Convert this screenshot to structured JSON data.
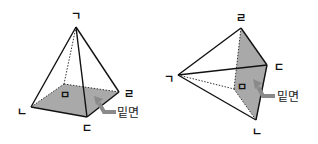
{
  "figures": [
    {
      "name": "upright-square-pyramid",
      "vertex_labels": {
        "apex": "ㄱ",
        "front_left": "ㄴ",
        "front_right": "ㄷ",
        "back_right": "ㄹ",
        "base_center": "ㅁ"
      },
      "base_label": "밑면"
    },
    {
      "name": "sideways-square-pyramid",
      "vertex_labels": {
        "apex": "ㄱ",
        "bottom": "ㄴ",
        "right": "ㄷ",
        "top": "ㄹ",
        "base_center": "ㅁ"
      },
      "base_label": "밑면"
    }
  ],
  "colors": {
    "base_fill": "#a9a9a9",
    "edge": "#111111",
    "arrow": "#8a8a8a"
  }
}
